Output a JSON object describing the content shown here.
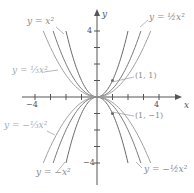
{
  "chart_data": {
    "type": "line",
    "title": "",
    "xlabel": "x",
    "ylabel": "y",
    "xlim": [
      -6,
      6
    ],
    "ylim": [
      -6,
      6
    ],
    "xticks": [
      -4,
      -3,
      -2,
      -1,
      1,
      2,
      3,
      4
    ],
    "yticks": [
      -4,
      -3,
      -2,
      -1,
      1,
      2,
      3,
      4
    ],
    "tick_labels": {
      "x": [
        "-4",
        "4"
      ],
      "y": [
        "4",
        "-4"
      ]
    },
    "grid": false,
    "legend": "inline labels",
    "series": [
      {
        "name": "y = x^2",
        "label": "y = x²",
        "coef": 1,
        "color": "#6a6a6a",
        "x": [
          -2,
          -1,
          0,
          1,
          2
        ],
        "values": [
          4,
          1,
          0,
          1,
          4
        ]
      },
      {
        "name": "y = 1/2 x^2",
        "label": "y = ½x²",
        "coef": 0.5,
        "color": "#7a7a7a",
        "x": [
          -2.83,
          -2,
          -1,
          0,
          1,
          2,
          2.83
        ],
        "values": [
          4,
          2,
          0.5,
          0,
          0.5,
          2,
          4
        ]
      },
      {
        "name": "y = 1/3 x^2",
        "label": "y = ⅓x²",
        "coef": 0.3333,
        "color": "#a0a0a0",
        "x": [
          -3.46,
          -3,
          -2,
          -1,
          0,
          1,
          2,
          3,
          3.46
        ],
        "values": [
          4,
          3,
          1.33,
          0.33,
          0,
          0.33,
          1.33,
          3,
          4
        ]
      },
      {
        "name": "y = -x^2",
        "label": "y = −x²",
        "coef": -1,
        "color": "#6a6a6a",
        "x": [
          -2,
          -1,
          0,
          1,
          2
        ],
        "values": [
          -4,
          -1,
          0,
          -1,
          -4
        ]
      },
      {
        "name": "y = -1/2 x^2",
        "label": "y = −½x²",
        "coef": -0.5,
        "color": "#7a7a7a",
        "x": [
          -2.83,
          -2,
          -1,
          0,
          1,
          2,
          2.83
        ],
        "values": [
          -4,
          -2,
          -0.5,
          0,
          -0.5,
          -2,
          -4
        ]
      },
      {
        "name": "y = -1/3 x^2",
        "label": "y = −⅓x²",
        "coef": -0.3333,
        "color": "#a0a0a0",
        "x": [
          -3.46,
          -3,
          -2,
          -1,
          0,
          1,
          2,
          3,
          3.46
        ],
        "values": [
          -4,
          -3,
          -1.33,
          -0.33,
          0,
          -0.33,
          -1.33,
          -3,
          -4
        ]
      }
    ],
    "annotations": [
      {
        "text": "(1, 1)",
        "x": 1,
        "y": 1
      },
      {
        "text": "(1, −1)",
        "x": 1,
        "y": -1
      }
    ]
  },
  "labels": {
    "y_x2": "y = x²",
    "y_half_x2": "y = ½x²",
    "y_third_x2": "y = ⅓x²",
    "y_neg_x2": "y = −x²",
    "y_neg_half_x2": "y = −½x²",
    "y_neg_third_x2": "y = −⅓x²",
    "pt_pos": "(1, 1)",
    "pt_neg": "(1, −1)",
    "x_axis": "x",
    "y_axis": "y",
    "tick_x_neg4": "−4",
    "tick_x_pos4": "4",
    "tick_y_pos4": "4",
    "tick_y_neg4": "−4"
  }
}
